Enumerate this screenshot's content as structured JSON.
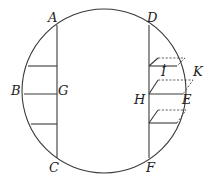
{
  "figure": {
    "type": "geometric-diagram",
    "colors": {
      "stroke": "#3a3a3a",
      "label": "#222222",
      "background": "#ffffff"
    },
    "circle": {
      "cx": 104,
      "cy": 91,
      "r": 82
    },
    "labels": {
      "A": "A",
      "B": "B",
      "C": "C",
      "D": "D",
      "E": "E",
      "F": "F",
      "G": "G",
      "H": "H",
      "I": "I",
      "K": "K"
    },
    "left_chord": {
      "name": "AC",
      "x": 57,
      "y1": 25,
      "y2": 158
    },
    "right_chord": {
      "name": "DF",
      "x": 149,
      "y1": 25,
      "y2": 158
    },
    "left_segments": [
      {
        "y": 66,
        "x1": 28,
        "x2": 57
      },
      {
        "y": 94,
        "x1": 24,
        "x2": 57,
        "name": "BG"
      },
      {
        "y": 124,
        "x1": 31,
        "x2": 57
      }
    ],
    "right_segments": [
      {
        "y": 66,
        "x1": 149,
        "x2": 177
      },
      {
        "y": 94,
        "x1": 149,
        "x2": 183,
        "name": "HE"
      },
      {
        "y": 123,
        "x1": 149,
        "x2": 177
      }
    ]
  }
}
